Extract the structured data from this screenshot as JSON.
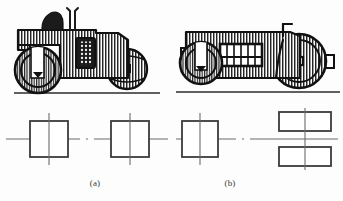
{
  "figure": {
    "kind": "technical-line-illustration",
    "background_color": "#fdfdfd",
    "ink_color": "#1a1a1a",
    "hatch_color": "#2a2a2a",
    "centerline_color": "#6b6b6b"
  },
  "captions": {
    "a": "(a)",
    "b": "(b)"
  },
  "machines": [
    {
      "id": "roller-a",
      "label": "(a)",
      "name": "three-wheel road roller",
      "parts": [
        "front roller drum",
        "operator seat",
        "control levers",
        "hatched body shell",
        "radiator grille panel",
        "rear roller drum",
        "ground line"
      ]
    },
    {
      "id": "roller-b",
      "label": "(b)",
      "name": "tandem road roller",
      "parts": [
        "front roller drum",
        "hatched body shell",
        "cab window opening",
        "steering column",
        "rear roller drum",
        "ground line"
      ]
    }
  ],
  "schematics": [
    {
      "id": "schematic-a",
      "label": "(a)",
      "views": [
        {
          "shape": "square",
          "width": 38,
          "height": 36,
          "centerlines": [
            "vertical",
            "horizontal"
          ]
        },
        {
          "shape": "square",
          "width": 38,
          "height": 36,
          "centerlines": [
            "vertical",
            "horizontal"
          ]
        }
      ],
      "axis": "single horizontal centerline spanning both views"
    },
    {
      "id": "schematic-b",
      "label": "(b)",
      "views": [
        {
          "shape": "square",
          "width": 36,
          "height": 36,
          "centerlines": [
            "vertical",
            "horizontal"
          ]
        },
        {
          "shape": "rectangle-pair",
          "width": 52,
          "height": 19,
          "count": 2,
          "centerlines": [
            "vertical",
            "horizontal"
          ]
        }
      ],
      "axis": "single horizontal centerline spanning both views"
    }
  ]
}
